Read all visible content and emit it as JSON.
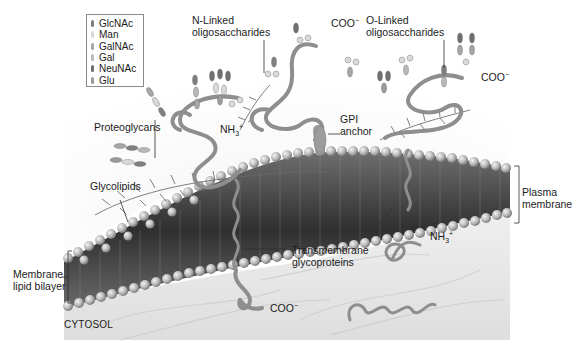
{
  "figure": {
    "type": "diagram"
  },
  "legend": {
    "items": [
      {
        "label": "GlcNAc",
        "color": "#7f7f7f"
      },
      {
        "label": "Man",
        "color": "#d9d9d9"
      },
      {
        "label": "GalNAc",
        "color": "#a6a6a6"
      },
      {
        "label": "Gal",
        "color": "#b8b8b8"
      },
      {
        "label": "NeuNAc",
        "color": "#6f6f6f"
      },
      {
        "label": "Glu",
        "color": "#9a9a9a"
      }
    ]
  },
  "labels": {
    "n_linked_line1": "N-Linked",
    "n_linked_line2": "oligosaccharides",
    "o_linked_line1": "O-Linked",
    "o_linked_line2": "oligosaccharides",
    "coo_top": "COO",
    "coo_right": "COO",
    "coo_bottom": "COO",
    "charge_minus": "−",
    "nh3_left": "NH",
    "nh3_right": "NH",
    "nh3_sub": "3",
    "charge_plus": "+",
    "proteoglycans": "Proteoglycans",
    "glycolipids": "Glycolipids",
    "gpi_line1": "GPI",
    "gpi_line2": "anchor",
    "plasma_line1": "Plasma",
    "plasma_line2": "membrane",
    "membrane_line1": "Membrane",
    "membrane_line2": "lipid bilayer",
    "transmembrane_line1": "Transmembrane",
    "transmembrane_line2": "glycoproteins",
    "cytosol": "CYTOSOL"
  },
  "colors": {
    "background": "#ffffff",
    "cytosol_fill": "#e9e9e9",
    "lipid_head": "#b5b5b5",
    "lipid_tail_region": "#4a4a4a",
    "protein_chain": "#8c8c8c",
    "leader_line": "#333333"
  }
}
